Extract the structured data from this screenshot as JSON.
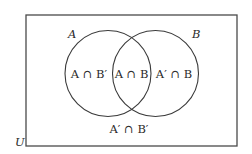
{
  "diagram": {
    "type": "venn",
    "universe": {
      "label": "U"
    },
    "sets": [
      {
        "name": "A",
        "label": "A"
      },
      {
        "name": "B",
        "label": "B"
      }
    ],
    "regions": {
      "a_only": "A ∩ B′",
      "intersection": "A ∩ B",
      "b_only": "A′ ∩ B",
      "neither": "A′ ∩ B′"
    },
    "colors": {
      "stroke": "#3a3a3a",
      "text": "#2a2a2a",
      "background": "#ffffff"
    }
  }
}
